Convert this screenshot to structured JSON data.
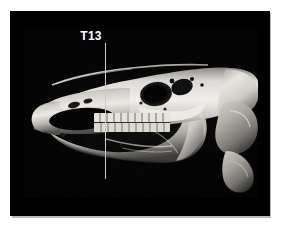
{
  "figure": {
    "kind": "volume-rendered-ct-skull",
    "background_color": "#000000",
    "page_background_color": "#ffffff",
    "panel": {
      "left": 10,
      "top": 11,
      "width": 260,
      "height": 205,
      "border_shadow_color": "#b9b9b9"
    }
  },
  "annotations": {
    "landmark": {
      "label": "T13",
      "label_color": "#ffffff",
      "line_color": "#c9c9c9",
      "line_x": 95,
      "line_top": 32,
      "line_height": 136
    }
  },
  "render": {
    "bone_highlight_color": "#f4f2ee",
    "bone_midtone_color": "#b9b6b0",
    "bone_shadow_color": "#5a5854",
    "cavity_color": "#050505",
    "structures": [
      "premaxilla",
      "nasal-aperture",
      "maxilla",
      "cheek-tooth-row",
      "orbit",
      "zygomatic-arch",
      "frontal-bone",
      "occipital-condyle",
      "mandible-ramus",
      "mandible-body",
      "atlas-vertebra",
      "axis-vertebra"
    ]
  }
}
